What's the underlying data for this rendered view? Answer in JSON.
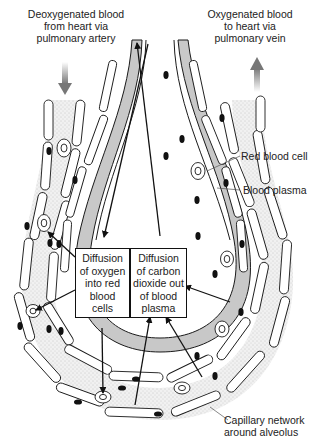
{
  "diagram": {
    "title_top_left": "Deoxygenated blood\nfrom heart via\npulmonary artery",
    "title_top_right": "Oxygenated blood\nto heart via\npulmonary vein",
    "labels": {
      "red_blood_cell": "Red blood cell",
      "blood_plasma": "Blood plasma",
      "capillary_network": "Capillary network\naround alveolus"
    },
    "boxes": {
      "oxygen": "Diffusion\nof oxygen\ninto red\nblood\ncells",
      "carbon_dioxide": "Diffusion\nof carbon\ndioxide out\nof blood\nplasma"
    },
    "colors": {
      "alveolus_wall": "#c8c8c8",
      "plasma_stipple": "#e9e9e9",
      "outline": "#1a1a1a",
      "flow_arrow": "#8a8a8a"
    }
  }
}
